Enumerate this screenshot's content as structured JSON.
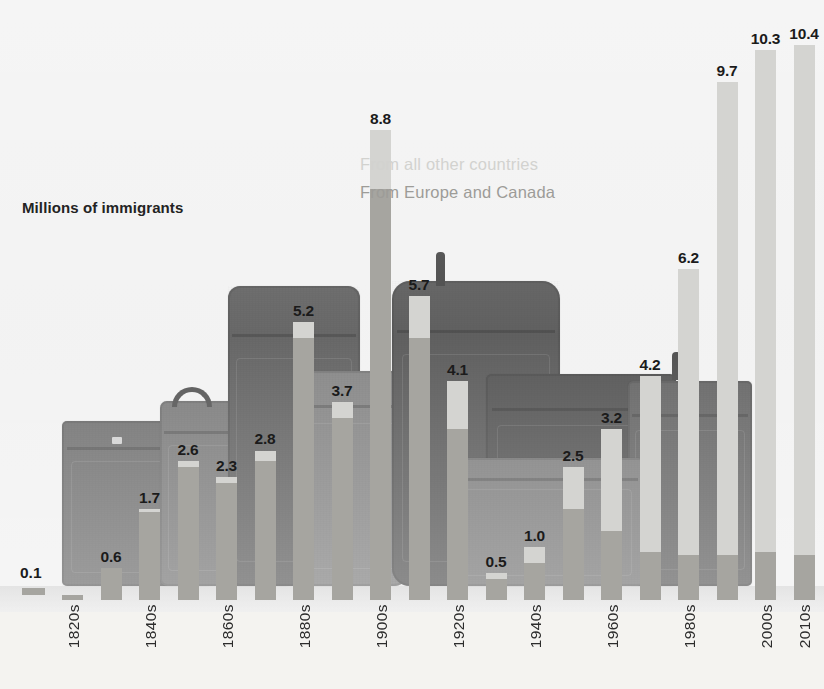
{
  "chart_data": {
    "type": "bar",
    "title": "Millions of immigrants",
    "xlabel": "",
    "ylabel": "Millions of immigrants",
    "ylim": [
      0,
      11
    ],
    "grid": false,
    "stacked": true,
    "legend_position": "inside-upper-center",
    "categories": [
      "1820s",
      "1830s",
      "1840s",
      "1850s",
      "1860s",
      "1870s",
      "1880s",
      "1890s",
      "1900s",
      "1910s",
      "1920s",
      "1930s",
      "1940s",
      "1950s",
      "1960s",
      "1970s",
      "1980s",
      "1990s",
      "2000s",
      "2010s"
    ],
    "tick_labels": [
      "1820s",
      "1840s",
      "1860s",
      "1880s",
      "1900s",
      "1920s",
      "1940s",
      "1960s",
      "1980s",
      "2000s",
      "2010s"
    ],
    "values": [
      0.1,
      0.6,
      1.7,
      2.6,
      2.3,
      2.8,
      5.2,
      3.7,
      8.8,
      5.7,
      4.1,
      0.5,
      1.0,
      2.5,
      3.2,
      4.2,
      6.2,
      9.7,
      10.3,
      10.4
    ],
    "value_labels": [
      "0.1",
      "0.6",
      "1.7",
      "2.6",
      "2.3",
      "2.8",
      "5.2",
      "3.7",
      "8.8",
      "5.7",
      "4.1",
      "0.5",
      "1.0",
      "2.5",
      "3.2",
      "4.2",
      "6.2",
      "9.7",
      "10.3",
      "10.4"
    ],
    "series": [
      {
        "name": "From Europe and Canada",
        "color": "#a6a5a0",
        "values": [
          0.1,
          0.6,
          1.65,
          2.5,
          2.2,
          2.6,
          4.9,
          3.4,
          7.7,
          4.9,
          3.2,
          0.4,
          0.7,
          1.7,
          1.3,
          0.9,
          0.85,
          0.85,
          0.9,
          0.85
        ]
      },
      {
        "name": "From all other countries",
        "color": "#d4d4d1",
        "values": [
          0.0,
          0.0,
          0.05,
          0.1,
          0.1,
          0.2,
          0.3,
          0.3,
          1.1,
          0.8,
          0.9,
          0.1,
          0.3,
          0.8,
          1.9,
          3.3,
          5.35,
          8.85,
          9.4,
          9.55
        ]
      }
    ]
  },
  "legend": {
    "other_countries": "From all other countries",
    "europe_canada": "From Europe and Canada"
  },
  "axis_title": "Millions of immigrants",
  "zero_label": "0.1",
  "caption": "",
  "colors": {
    "other_countries": "#d4d4d1",
    "europe_canada": "#a6a5a0",
    "label_text": "#1b1b1b",
    "background": "#f4f3f0"
  }
}
